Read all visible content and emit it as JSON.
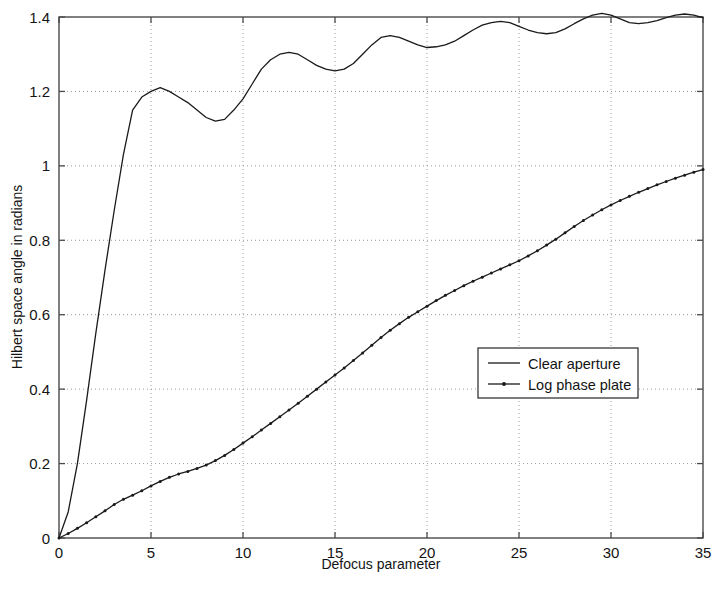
{
  "chart_data": {
    "type": "line",
    "title": "",
    "xlabel": "Defocus parameter",
    "ylabel": "Hilbert space angle in radians",
    "xlim": [
      0,
      35
    ],
    "ylim": [
      0,
      1.4
    ],
    "xticks": [
      "0",
      "5",
      "10",
      "15",
      "20",
      "25",
      "30",
      "35"
    ],
    "xtick_values": [
      0,
      5,
      10,
      15,
      20,
      25,
      30,
      35
    ],
    "yticks": [
      "0",
      "0.2",
      "0.4",
      "0.6",
      "0.8",
      "1",
      "1.2",
      "1.4"
    ],
    "ytick_values": [
      0,
      0.2,
      0.4,
      0.6,
      0.8,
      1.0,
      1.2,
      1.4
    ],
    "grid": "dotted",
    "legend_position": "center-right",
    "series": [
      {
        "name": "Clear aperture",
        "marker": "none",
        "color": "#1a1a1a",
        "x": [
          0,
          0.5,
          1,
          1.5,
          2,
          2.5,
          3,
          3.5,
          4,
          4.5,
          5,
          5.5,
          6,
          6.5,
          7,
          7.5,
          8,
          8.5,
          9,
          9.5,
          10,
          10.5,
          11,
          11.5,
          12,
          12.5,
          13,
          13.5,
          14,
          14.5,
          15,
          15.5,
          16,
          16.5,
          17,
          17.5,
          18,
          18.5,
          19,
          19.5,
          20,
          20.5,
          21,
          21.5,
          22,
          22.5,
          23,
          23.5,
          24,
          24.5,
          25,
          25.5,
          26,
          26.5,
          27,
          27.5,
          28,
          28.5,
          29,
          29.5,
          30,
          30.5,
          31,
          31.5,
          32,
          32.5,
          33,
          33.5,
          34,
          34.5,
          35
        ],
        "y": [
          0.0,
          0.07,
          0.2,
          0.37,
          0.55,
          0.72,
          0.88,
          1.03,
          1.15,
          1.185,
          1.2,
          1.21,
          1.2,
          1.185,
          1.17,
          1.15,
          1.13,
          1.12,
          1.125,
          1.15,
          1.18,
          1.22,
          1.26,
          1.285,
          1.3,
          1.305,
          1.3,
          1.285,
          1.27,
          1.26,
          1.255,
          1.26,
          1.275,
          1.3,
          1.325,
          1.345,
          1.35,
          1.345,
          1.335,
          1.325,
          1.318,
          1.32,
          1.325,
          1.335,
          1.35,
          1.365,
          1.378,
          1.385,
          1.388,
          1.385,
          1.375,
          1.365,
          1.358,
          1.355,
          1.358,
          1.368,
          1.382,
          1.395,
          1.405,
          1.41,
          1.405,
          1.395,
          1.385,
          1.382,
          1.385,
          1.39,
          1.398,
          1.405,
          1.408,
          1.405,
          1.398
        ]
      },
      {
        "name": "Log phase plate",
        "marker": "dot",
        "color": "#1a1a1a",
        "x": [
          0,
          0.5,
          1,
          1.5,
          2,
          2.5,
          3,
          3.5,
          4,
          4.5,
          5,
          5.5,
          6,
          6.5,
          7,
          7.5,
          8,
          8.5,
          9,
          9.5,
          10,
          10.5,
          11,
          11.5,
          12,
          12.5,
          13,
          13.5,
          14,
          14.5,
          15,
          15.5,
          16,
          16.5,
          17,
          17.5,
          18,
          18.5,
          19,
          19.5,
          20,
          20.5,
          21,
          21.5,
          22,
          22.5,
          23,
          23.5,
          24,
          24.5,
          25,
          25.5,
          26,
          26.5,
          27,
          27.5,
          28,
          28.5,
          29,
          29.5,
          30,
          30.5,
          31,
          31.5,
          32,
          32.5,
          33,
          33.5,
          34,
          34.5,
          35
        ],
        "y": [
          0.0,
          0.012,
          0.026,
          0.041,
          0.057,
          0.073,
          0.09,
          0.104,
          0.115,
          0.127,
          0.14,
          0.152,
          0.163,
          0.172,
          0.179,
          0.187,
          0.196,
          0.208,
          0.222,
          0.238,
          0.255,
          0.272,
          0.29,
          0.308,
          0.326,
          0.344,
          0.362,
          0.381,
          0.4,
          0.419,
          0.438,
          0.457,
          0.477,
          0.497,
          0.518,
          0.539,
          0.558,
          0.576,
          0.593,
          0.608,
          0.623,
          0.638,
          0.652,
          0.665,
          0.678,
          0.69,
          0.701,
          0.712,
          0.723,
          0.734,
          0.745,
          0.758,
          0.772,
          0.787,
          0.803,
          0.82,
          0.837,
          0.853,
          0.868,
          0.882,
          0.895,
          0.907,
          0.918,
          0.929,
          0.939,
          0.949,
          0.958,
          0.967,
          0.975,
          0.983,
          0.99
        ]
      }
    ]
  },
  "legend": {
    "entries": [
      {
        "label": "Clear aperture",
        "marker": "none"
      },
      {
        "label": "Log phase plate",
        "marker": "dot"
      }
    ]
  },
  "axes": {
    "x_title": "Defocus parameter",
    "y_title": "Hilbert space angle in radians"
  },
  "colors": {
    "line": "#1a1a1a",
    "axis": "#4a4a4a",
    "grid": "#9a9a9a",
    "background": "#ffffff"
  }
}
